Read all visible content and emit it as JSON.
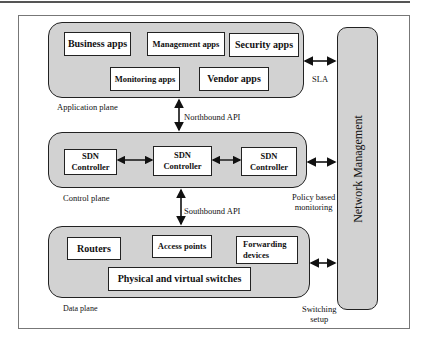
{
  "diagram": {
    "application_plane": {
      "label": "Application plane",
      "boxes": [
        "Business apps",
        "Management apps",
        "Security apps",
        "Monitoring apps",
        "Vendor apps"
      ]
    },
    "northbound_api": "Northbound API",
    "control_plane": {
      "label": "Control plane",
      "controllers": [
        {
          "line1": "SDN",
          "line2": "Controller"
        },
        {
          "line1": "SDN",
          "line2": "Controller"
        },
        {
          "line1": "SDN",
          "line2": "Controller"
        }
      ]
    },
    "southbound_api": "Southbound API",
    "data_plane": {
      "label": "Data plane",
      "boxes": [
        "Routers",
        "Access points",
        "Forwarding devices",
        "Physical and virtual switches"
      ]
    },
    "network_management": "Network Management",
    "side_links": {
      "sla": "SLA",
      "policy_line1": "Policy based",
      "policy_line2": "monitoring",
      "switching_line1": "Switching",
      "switching_line2": "setup"
    },
    "colors": {
      "plane_fill": "#d2d2d2",
      "box_fill": "#ffffff",
      "stroke": "#222222"
    }
  }
}
